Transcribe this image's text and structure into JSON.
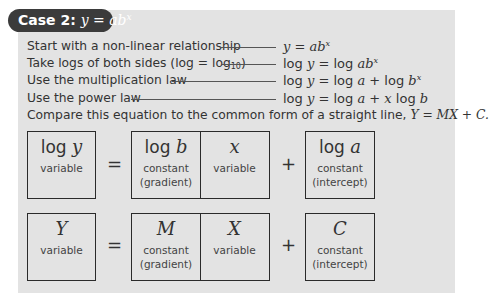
{
  "title": {
    "label": "Case 2:",
    "formula_base": "y = ab",
    "formula_exp": "x"
  },
  "steps": [
    {
      "text": "Start with a non-linear relationship",
      "eq_pre": "y = ab",
      "eq_sup": "x",
      "eq_post": ""
    },
    {
      "text": "Take logs of both sides (log = log",
      "sub": "10",
      "text_end": ")",
      "eq_pre": "log y = log ab",
      "eq_sup": "x",
      "eq_post": ""
    },
    {
      "text": "Use the multiplication law",
      "eq_pre": "log y = log a + log b",
      "eq_sup": "x",
      "eq_post": ""
    },
    {
      "text": "Use the power law",
      "eq_pre": "log y = log a + x log b",
      "eq_sup": "",
      "eq_post": ""
    }
  ],
  "compare": {
    "text": "Compare this equation to the common form of a straight line, ",
    "formula": "Y = MX + C."
  },
  "row1": {
    "b1": {
      "term_fn": "log",
      "term_var": "y",
      "label": "variable"
    },
    "equals": "=",
    "b2": {
      "term_fn": "log",
      "term_var": "b",
      "label1": "constant",
      "label2": "(gradient)"
    },
    "b3": {
      "term_var": "x",
      "label": "variable"
    },
    "plus": "+",
    "b4": {
      "term_fn": "log",
      "term_var": "a",
      "label1": "constant",
      "label2": "(intercept)"
    }
  },
  "row2": {
    "b1": {
      "term_var": "Y",
      "label": "variable"
    },
    "equals": "=",
    "b2": {
      "term_var": "M",
      "label1": "constant",
      "label2": "(gradient)"
    },
    "b3": {
      "term_var": "X",
      "label": "variable"
    },
    "plus": "+",
    "b4": {
      "term_var": "C",
      "label1": "constant",
      "label2": "(intercept)"
    }
  }
}
